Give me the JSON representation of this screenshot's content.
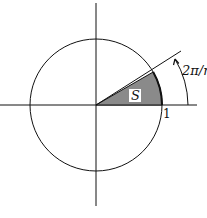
{
  "diagram": {
    "title": "",
    "sector_label": "S",
    "angle_label": "2π/n",
    "radius_label": "1",
    "colors": {
      "stroke": "#111111",
      "sector_fill": "#8a8a8a",
      "label_box": "#ffffff"
    },
    "geometry": {
      "center": [
        96,
        105
      ],
      "radius": 66,
      "angle_deg": 30
    }
  }
}
